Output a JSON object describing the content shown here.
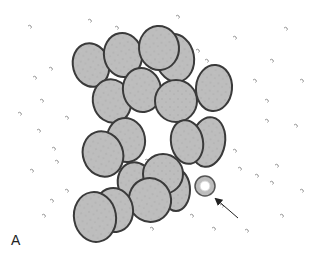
{
  "figure": {
    "panel_label": "A",
    "colors": {
      "background": "#ffffff",
      "cell_fill": "#bdbdbd",
      "cell_outline": "#3a3a3a",
      "ring_fill": "#bdbdbd",
      "ring_center": "#ffffff",
      "arrow": "#222222",
      "debris": "#7a7a7a"
    },
    "cells": [
      {
        "cx": 175,
        "cy": 58,
        "rx": 19,
        "ry": 24,
        "rot": -10
      },
      {
        "cx": 91,
        "cy": 65,
        "rx": 18,
        "ry": 22,
        "rot": -15
      },
      {
        "cx": 123,
        "cy": 55,
        "rx": 19,
        "ry": 22,
        "rot": -10
      },
      {
        "cx": 112,
        "cy": 101,
        "rx": 19,
        "ry": 22,
        "rot": -15
      },
      {
        "cx": 142,
        "cy": 90,
        "rx": 19,
        "ry": 22,
        "rot": -10
      },
      {
        "cx": 159,
        "cy": 48,
        "rx": 20,
        "ry": 22,
        "rot": -5
      },
      {
        "cx": 176,
        "cy": 101,
        "rx": 21,
        "ry": 21,
        "rot": 0
      },
      {
        "cx": 214,
        "cy": 88,
        "rx": 18,
        "ry": 23,
        "rot": 5
      },
      {
        "cx": 208,
        "cy": 142,
        "rx": 17,
        "ry": 25,
        "rot": 10
      },
      {
        "cx": 187,
        "cy": 142,
        "rx": 16,
        "ry": 22,
        "rot": -10
      },
      {
        "cx": 126,
        "cy": 140,
        "rx": 19,
        "ry": 22,
        "rot": -10
      },
      {
        "cx": 103,
        "cy": 154,
        "rx": 20,
        "ry": 23,
        "rot": -20
      },
      {
        "cx": 176,
        "cy": 190,
        "rx": 14,
        "ry": 21,
        "rot": 0
      },
      {
        "cx": 136,
        "cy": 184,
        "rx": 18,
        "ry": 22,
        "rot": -15
      },
      {
        "cx": 163,
        "cy": 174,
        "rx": 20,
        "ry": 20,
        "rot": 0
      },
      {
        "cx": 150,
        "cy": 200,
        "rx": 21,
        "ry": 22,
        "rot": -15
      },
      {
        "cx": 114,
        "cy": 210,
        "rx": 19,
        "ry": 22,
        "rot": -10
      },
      {
        "cx": 95,
        "cy": 217,
        "rx": 21,
        "ry": 25,
        "rot": -10
      }
    ],
    "ring_particle": {
      "cx": 205,
      "cy": 186,
      "r": 10,
      "inner_r": 5
    },
    "arrow": {
      "x1": 238,
      "y1": 218,
      "x2": 216,
      "y2": 199
    },
    "debris": [
      [
        28,
        26
      ],
      [
        88,
        20
      ],
      [
        115,
        27
      ],
      [
        49,
        68
      ],
      [
        33,
        77
      ],
      [
        18,
        113
      ],
      [
        37,
        130
      ],
      [
        65,
        117
      ],
      [
        52,
        148
      ],
      [
        55,
        161
      ],
      [
        30,
        170
      ],
      [
        50,
        200
      ],
      [
        42,
        215
      ],
      [
        65,
        190
      ],
      [
        92,
        200
      ],
      [
        176,
        16
      ],
      [
        196,
        50
      ],
      [
        205,
        60
      ],
      [
        233,
        37
      ],
      [
        284,
        28
      ],
      [
        253,
        80
      ],
      [
        265,
        100
      ],
      [
        294,
        125
      ],
      [
        275,
        165
      ],
      [
        238,
        168
      ],
      [
        255,
        175
      ],
      [
        270,
        182
      ],
      [
        300,
        190
      ],
      [
        233,
        150
      ],
      [
        220,
        205
      ],
      [
        245,
        230
      ],
      [
        280,
        215
      ],
      [
        265,
        120
      ],
      [
        300,
        80
      ],
      [
        270,
        60
      ],
      [
        40,
        100
      ],
      [
        190,
        215
      ],
      [
        150,
        228
      ],
      [
        212,
        228
      ],
      [
        145,
        160
      ]
    ]
  }
}
